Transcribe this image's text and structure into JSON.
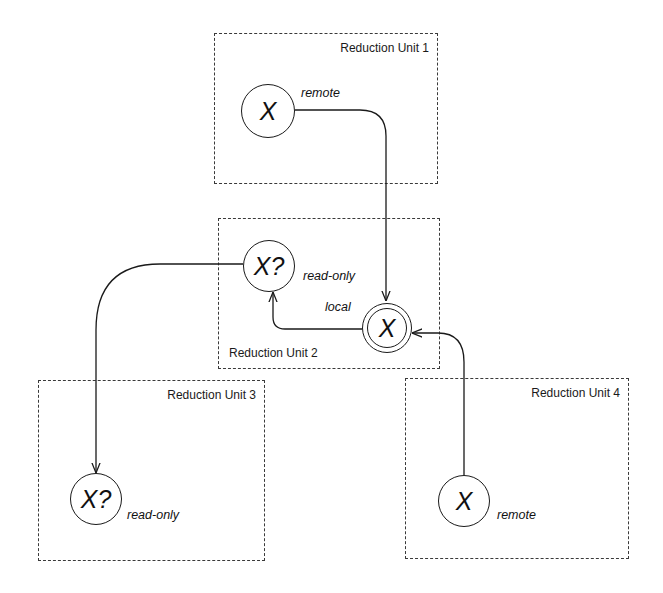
{
  "diagram": {
    "type": "reduction-unit-data-access",
    "units": [
      {
        "id": "ru1",
        "title": "Reduction Unit 1"
      },
      {
        "id": "ru2",
        "title": "Reduction Unit 2"
      },
      {
        "id": "ru3",
        "title": "Reduction Unit 3"
      },
      {
        "id": "ru4",
        "title": "Reduction Unit 4"
      }
    ],
    "nodes": [
      {
        "id": "ru1-x",
        "unit": "ru1",
        "symbol": "X",
        "label": "remote",
        "style": "single"
      },
      {
        "id": "ru2-xq",
        "unit": "ru2",
        "symbol": "X?",
        "label": "read-only",
        "style": "single"
      },
      {
        "id": "ru2-x",
        "unit": "ru2",
        "symbol": "X",
        "label": "local",
        "style": "double"
      },
      {
        "id": "ru3-xq",
        "unit": "ru3",
        "symbol": "X?",
        "label": "read-only",
        "style": "single"
      },
      {
        "id": "ru4-x",
        "unit": "ru4",
        "symbol": "X",
        "label": "remote",
        "style": "single"
      }
    ],
    "edges": [
      {
        "from": "ru1-x",
        "to": "ru2-x"
      },
      {
        "from": "ru4-x",
        "to": "ru2-x"
      },
      {
        "from": "ru2-x",
        "to": "ru2-xq"
      },
      {
        "from": "ru2-xq",
        "to": "ru3-xq"
      }
    ],
    "colors": {
      "line": "#1a1a1a",
      "background": "#ffffff"
    }
  }
}
